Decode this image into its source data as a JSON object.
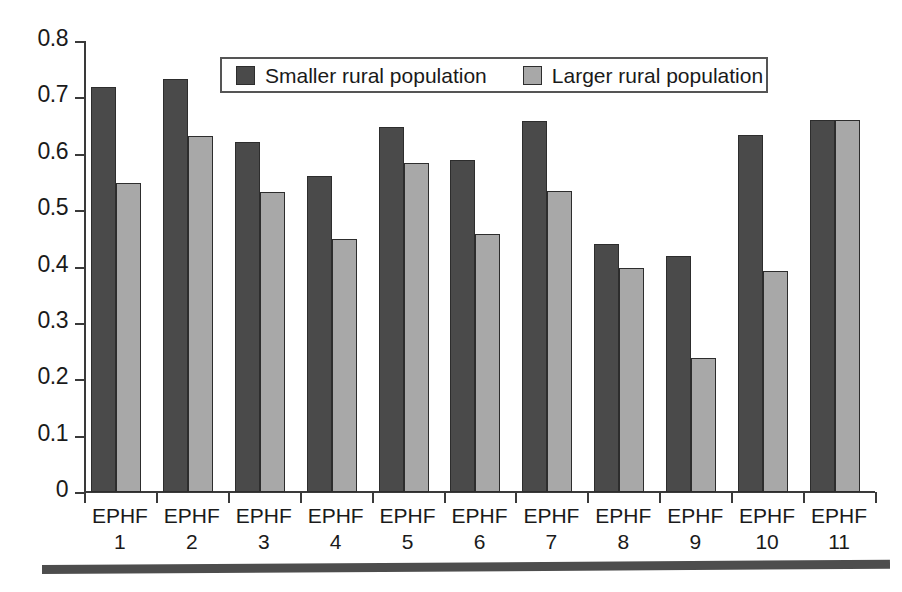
{
  "chart_data": {
    "type": "bar",
    "title": "",
    "subtitle": "",
    "xlabel": "",
    "ylabel": "",
    "ylim": [
      0,
      0.8
    ],
    "ytick_labels": [
      "0",
      "0.1",
      "0.2",
      "0.3",
      "0.4",
      "0.5",
      "0.6",
      "0.7",
      "0.8"
    ],
    "ytick_values": [
      0,
      0.1,
      0.2,
      0.3,
      0.4,
      0.5,
      0.6,
      0.7,
      0.8
    ],
    "grid": false,
    "legend_position": "top-center",
    "categories": [
      "EPHF 1",
      "EPHF 2",
      "EPHF 3",
      "EPHF 4",
      "EPHF 5",
      "EPHF 6",
      "EPHF 7",
      "EPHF 8",
      "EPHF 9",
      "EPHF 10",
      "EPHF 11"
    ],
    "category_lines": [
      [
        "EPHF",
        "1"
      ],
      [
        "EPHF",
        "2"
      ],
      [
        "EPHF",
        "3"
      ],
      [
        "EPHF",
        "4"
      ],
      [
        "EPHF",
        "5"
      ],
      [
        "EPHF",
        "6"
      ],
      [
        "EPHF",
        "7"
      ],
      [
        "EPHF",
        "8"
      ],
      [
        "EPHF",
        "9"
      ],
      [
        "EPHF",
        "10"
      ],
      [
        "EPHF",
        "11"
      ]
    ],
    "series": [
      {
        "name": "Smaller rural population",
        "color": "#4a4a4a",
        "values": [
          0.718,
          0.733,
          0.62,
          0.56,
          0.648,
          0.589,
          0.659,
          0.44,
          0.418,
          0.633,
          0.66
        ]
      },
      {
        "name": "Larger rural population",
        "color": "#a8a8a8",
        "values": [
          0.548,
          0.632,
          0.533,
          0.448,
          0.583,
          0.457,
          0.534,
          0.398,
          0.237,
          0.392,
          0.66
        ]
      }
    ]
  },
  "legend": {
    "items": [
      {
        "label": "Smaller rural population",
        "swatch": "dark-gray-swatch"
      },
      {
        "label": "Larger rural population",
        "swatch": "light-gray-swatch"
      }
    ]
  },
  "decoration": {
    "bottom_rule": ""
  }
}
